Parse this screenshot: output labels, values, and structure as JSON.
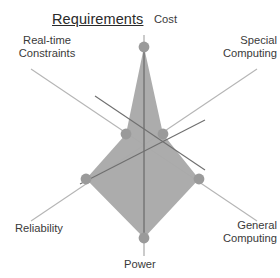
{
  "figure": {
    "title": "Requirements",
    "background_color": "#ffffff"
  },
  "axis_labels": {
    "cost": "Cost",
    "special_computing_line1": "Special",
    "special_computing_line2": "Computing",
    "general_computing_line1": "General",
    "general_computing_line2": "Computing",
    "power": "Power",
    "reliability": "Reliability",
    "realtime_line1": "Real-time",
    "realtime_line2": "Constraints"
  },
  "colors": {
    "fill": "#a9a9a9",
    "marker": "#9a9a9a",
    "axis_light": "#b5b5b5",
    "axis_dark": "#6f6f6f",
    "text": "#3a3a3a",
    "title_text": "#2a2a2a"
  },
  "chart_data": {
    "type": "radar",
    "title": "Requirements",
    "categories": [
      "Cost",
      "Special Computing",
      "General Computing",
      "Power",
      "Reliability",
      "Real-time Constraints"
    ],
    "series": [
      {
        "name": "Requirements",
        "values": [
          0.88,
          0.18,
          0.48,
          0.84,
          0.5,
          0.2
        ]
      }
    ],
    "rlim": [
      0,
      1
    ],
    "grid": false,
    "legend": false,
    "axis_order_degrees": [
      90,
      30,
      330,
      270,
      210,
      150
    ]
  },
  "geometry": {
    "center_x": 144,
    "center_y": 145,
    "spoke_pixel_length": 115,
    "vertex_pixels": [
      {
        "axis": "Cost",
        "x": 144,
        "y": 47
      },
      {
        "axis": "Special Computing",
        "x": 163,
        "y": 134
      },
      {
        "axis": "General Computing",
        "x": 199,
        "y": 179
      },
      {
        "axis": "Power",
        "x": 144,
        "y": 238
      },
      {
        "axis": "Reliability",
        "x": 86,
        "y": 179
      },
      {
        "axis": "Real-time Constraints",
        "x": 126,
        "y": 134
      }
    ],
    "axis_endpoints": [
      {
        "axis": "Cost",
        "x": 144,
        "y": 35
      },
      {
        "axis": "Special Computing",
        "x": 257,
        "y": 69
      },
      {
        "axis": "General Computing",
        "x": 257,
        "y": 221
      },
      {
        "axis": "Power",
        "x": 144,
        "y": 256
      },
      {
        "axis": "Reliability",
        "x": 31,
        "y": 221
      },
      {
        "axis": "Real-time Constraints",
        "x": 31,
        "y": 69
      }
    ]
  }
}
